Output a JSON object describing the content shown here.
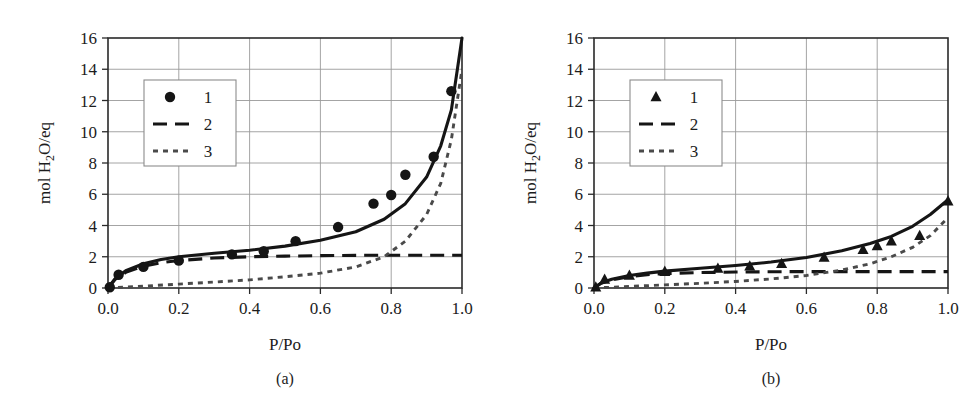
{
  "figure": {
    "panels": [
      {
        "id": "a",
        "caption": "(a)",
        "xlabel": "P/Po",
        "ylabel_main": "mol H",
        "ylabel_sub": "2",
        "ylabel_tail": "O/eq",
        "legend": [
          {
            "label": "1",
            "style": "circle-marker"
          },
          {
            "label": "2",
            "style": "long-dash"
          },
          {
            "label": "3",
            "style": "short-dot"
          }
        ]
      },
      {
        "id": "b",
        "caption": "(b)",
        "xlabel": "P/Po",
        "ylabel_main": "mol H",
        "ylabel_sub": "2",
        "ylabel_tail": "O/eq",
        "legend": [
          {
            "label": "1",
            "style": "triangle-marker"
          },
          {
            "label": "2",
            "style": "long-dash"
          },
          {
            "label": "3",
            "style": "short-dot"
          }
        ]
      }
    ]
  },
  "chart_data": [
    {
      "type": "scatter",
      "panel": "a",
      "title": "(a)",
      "xlabel": "P/Po",
      "ylabel": "mol H2O/eq",
      "xlim": [
        0.0,
        1.0
      ],
      "ylim": [
        0,
        16
      ],
      "xticks": [
        0.0,
        0.2,
        0.4,
        0.6,
        0.8,
        1.0
      ],
      "xticklabels": [
        "0.0",
        "0.2",
        "0.4",
        "0.6",
        "0.8",
        "1.0"
      ],
      "yticks": [
        0,
        2,
        4,
        6,
        8,
        10,
        12,
        14,
        16
      ],
      "yticklabels": [
        "0",
        "2",
        "4",
        "6",
        "8",
        "10",
        "12",
        "14",
        "16"
      ],
      "grid": true,
      "legend_position": "upper-left-inset",
      "series": [
        {
          "name": "1",
          "marker": "circle",
          "linestyle": "none",
          "x": [
            0.005,
            0.03,
            0.1,
            0.2,
            0.35,
            0.44,
            0.53,
            0.65,
            0.75,
            0.8,
            0.84,
            0.92,
            0.97
          ],
          "y": [
            0.05,
            0.85,
            1.35,
            1.75,
            2.15,
            2.35,
            3.0,
            3.9,
            5.4,
            5.95,
            7.25,
            8.4,
            12.6
          ]
        },
        {
          "name": "2",
          "marker": "none",
          "linestyle": "long-dash",
          "x": [
            0.0,
            0.02,
            0.05,
            0.1,
            0.15,
            0.2,
            0.3,
            0.4,
            0.5,
            0.6,
            0.7,
            0.8,
            0.9,
            1.0
          ],
          "y": [
            0.0,
            0.55,
            1.0,
            1.4,
            1.62,
            1.76,
            1.92,
            2.0,
            2.04,
            2.07,
            2.09,
            2.1,
            2.1,
            2.1
          ]
        },
        {
          "name": "3",
          "marker": "none",
          "linestyle": "short-dot",
          "x": [
            0.0,
            0.1,
            0.2,
            0.3,
            0.4,
            0.5,
            0.6,
            0.7,
            0.78,
            0.84,
            0.9,
            0.94,
            0.97,
            1.0
          ],
          "y": [
            0.0,
            0.12,
            0.25,
            0.38,
            0.52,
            0.72,
            0.95,
            1.35,
            2.0,
            3.0,
            4.7,
            6.7,
            9.5,
            14.0
          ]
        },
        {
          "name": "total-fit",
          "marker": "none",
          "linestyle": "solid",
          "x": [
            0.0,
            0.02,
            0.05,
            0.1,
            0.15,
            0.2,
            0.3,
            0.4,
            0.5,
            0.6,
            0.7,
            0.78,
            0.84,
            0.9,
            0.94,
            0.97,
            1.0
          ],
          "y": [
            0.0,
            0.6,
            1.1,
            1.55,
            1.82,
            2.0,
            2.22,
            2.42,
            2.68,
            3.05,
            3.6,
            4.4,
            5.4,
            7.1,
            9.1,
            11.4,
            16.0
          ]
        }
      ]
    },
    {
      "type": "scatter",
      "panel": "b",
      "title": "(b)",
      "xlabel": "P/Po",
      "ylabel": "mol H2O/eq",
      "xlim": [
        0.0,
        1.0
      ],
      "ylim": [
        0,
        16
      ],
      "xticks": [
        0.0,
        0.2,
        0.4,
        0.6,
        0.8,
        1.0
      ],
      "xticklabels": [
        "0.0",
        "0.2",
        "0.4",
        "0.6",
        "0.8",
        "1.0"
      ],
      "yticks": [
        0,
        2,
        4,
        6,
        8,
        10,
        12,
        14,
        16
      ],
      "yticklabels": [
        "0",
        "2",
        "4",
        "6",
        "8",
        "10",
        "12",
        "14",
        "16"
      ],
      "grid": true,
      "legend_position": "upper-left-inset",
      "series": [
        {
          "name": "1",
          "marker": "triangle",
          "linestyle": "none",
          "x": [
            0.005,
            0.03,
            0.1,
            0.2,
            0.35,
            0.44,
            0.53,
            0.65,
            0.76,
            0.8,
            0.84,
            0.92,
            1.0
          ],
          "y": [
            0.05,
            0.55,
            0.8,
            1.05,
            1.25,
            1.4,
            1.55,
            1.95,
            2.45,
            2.7,
            3.0,
            3.35,
            5.55
          ]
        },
        {
          "name": "2",
          "marker": "none",
          "linestyle": "long-dash",
          "x": [
            0.0,
            0.02,
            0.05,
            0.1,
            0.15,
            0.2,
            0.3,
            0.4,
            0.5,
            0.6,
            0.7,
            0.8,
            0.9,
            1.0
          ],
          "y": [
            0.0,
            0.3,
            0.52,
            0.72,
            0.85,
            0.92,
            0.99,
            1.02,
            1.04,
            1.05,
            1.05,
            1.05,
            1.05,
            1.05
          ]
        },
        {
          "name": "3",
          "marker": "none",
          "linestyle": "short-dot",
          "x": [
            0.0,
            0.1,
            0.2,
            0.3,
            0.4,
            0.5,
            0.6,
            0.7,
            0.78,
            0.84,
            0.9,
            0.95,
            1.0
          ],
          "y": [
            0.0,
            0.1,
            0.2,
            0.3,
            0.42,
            0.58,
            0.8,
            1.15,
            1.55,
            2.0,
            2.6,
            3.35,
            4.5
          ]
        },
        {
          "name": "total-fit",
          "marker": "none",
          "linestyle": "solid",
          "x": [
            0.0,
            0.02,
            0.05,
            0.1,
            0.15,
            0.2,
            0.3,
            0.4,
            0.5,
            0.6,
            0.7,
            0.78,
            0.84,
            0.9,
            0.95,
            1.0
          ],
          "y": [
            0.0,
            0.32,
            0.56,
            0.8,
            0.95,
            1.08,
            1.26,
            1.44,
            1.66,
            1.95,
            2.38,
            2.85,
            3.3,
            3.95,
            4.7,
            5.65
          ]
        }
      ]
    }
  ]
}
